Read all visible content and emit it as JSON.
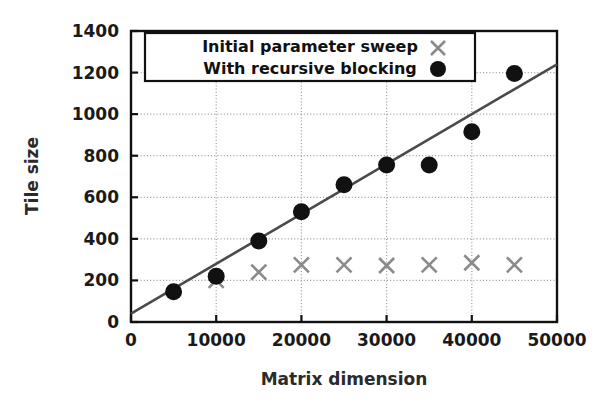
{
  "chart_data": {
    "type": "scatter",
    "title": "",
    "xlabel": "Matrix dimension",
    "ylabel": "Tile size",
    "xlim": [
      0,
      50000
    ],
    "ylim": [
      0,
      1400
    ],
    "xticks": [
      0,
      10000,
      20000,
      30000,
      40000,
      50000
    ],
    "yticks": [
      0,
      200,
      400,
      600,
      800,
      1000,
      1200,
      1400
    ],
    "xtick_labels": [
      "0",
      "10000",
      "20000",
      "30000",
      "40000",
      "50000"
    ],
    "ytick_labels": [
      "0",
      "200",
      "400",
      "600",
      "800",
      "1000",
      "1200",
      "1400"
    ],
    "grid": true,
    "grid_style": "dotted",
    "legend_position": "upper left",
    "series": [
      {
        "name": "Initial parameter sweep",
        "marker": "x",
        "color": "#8a8a8a",
        "x": [
          10000,
          15000,
          20000,
          25000,
          30000,
          35000,
          40000,
          45000
        ],
        "y": [
          200,
          240,
          275,
          275,
          272,
          275,
          285,
          275
        ]
      },
      {
        "name": "With recursive blocking",
        "marker": "o",
        "color": "#111111",
        "x": [
          5000,
          10000,
          15000,
          20000,
          25000,
          30000,
          35000,
          40000,
          45000
        ],
        "y": [
          145,
          220,
          390,
          530,
          660,
          755,
          755,
          915,
          1195
        ]
      }
    ],
    "trendline": {
      "name": "linear fit",
      "color": "#4a4a4a",
      "x": [
        0,
        50000
      ],
      "y": [
        40,
        1240
      ]
    },
    "legend_entries": [
      {
        "label": "Initial parameter sweep",
        "marker": "x",
        "color": "#8a8a8a"
      },
      {
        "label": "With recursive blocking",
        "marker": "o",
        "color": "#111111"
      }
    ]
  }
}
